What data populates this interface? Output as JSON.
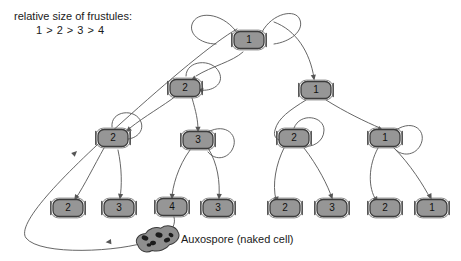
{
  "figure": {
    "legend": {
      "line1": "relative size of frustules:",
      "line2": "1 > 2 > 3 > 4"
    },
    "auxospore_label": "Auxospore (naked cell)",
    "colors": {
      "cell_fill": "#969696",
      "cell_stroke": "#3c3c3c",
      "line": "#555555",
      "background": "#ffffff",
      "auxospore_fill": "#8e8e8e",
      "auxospore_spot": "#1c1c1c",
      "text": "#1a1a1a"
    },
    "cells": [
      {
        "id": "c1",
        "label": "1",
        "x": 249,
        "y": 40
      },
      {
        "id": "c2",
        "label": "2",
        "x": 185,
        "y": 88
      },
      {
        "id": "c3",
        "label": "1",
        "x": 316,
        "y": 90
      },
      {
        "id": "c4",
        "label": "2",
        "x": 113,
        "y": 138
      },
      {
        "id": "c5",
        "label": "3",
        "x": 198,
        "y": 140
      },
      {
        "id": "c6",
        "label": "2",
        "x": 294,
        "y": 138
      },
      {
        "id": "c7",
        "label": "1",
        "x": 385,
        "y": 138
      },
      {
        "id": "c8",
        "label": "2",
        "x": 68,
        "y": 208
      },
      {
        "id": "c9",
        "label": "3",
        "x": 119,
        "y": 208
      },
      {
        "id": "c10",
        "label": "4",
        "x": 172,
        "y": 207
      },
      {
        "id": "c11",
        "label": "3",
        "x": 218,
        "y": 208
      },
      {
        "id": "c12",
        "label": "2",
        "x": 285,
        "y": 208
      },
      {
        "id": "c13",
        "label": "3",
        "x": 332,
        "y": 208
      },
      {
        "id": "c14",
        "label": "2",
        "x": 385,
        "y": 208
      },
      {
        "id": "c15",
        "label": "1",
        "x": 432,
        "y": 208
      }
    ],
    "auxospore": {
      "x": 158,
      "y": 239
    },
    "edges": [
      {
        "name": "aux-to-top-cell-1",
        "d": "M 150 241 C 120 252, 40 256, 26 238 C 16 224, 60 178, 120 124 C 170 79, 214 42, 237 29",
        "arrow_at": [
          [
            107,
            242
          ],
          [
            76,
            152
          ]
        ]
      },
      {
        "name": "cell1-loop-left",
        "d": "M 238 34 C 225 14, 200 10, 193 22 C 187 33, 200 44, 216 44"
      },
      {
        "name": "cell1-to-cell2",
        "d": "M 243 52 C 232 62, 212 66, 196 76",
        "arrow_at": [
          [
            192,
            80
          ]
        ]
      },
      {
        "name": "cell1-loop-right",
        "d": "M 262 32 C 272 13, 296 8, 300 20 C 304 31, 290 42, 274 44"
      },
      {
        "name": "cell1-to-cell3",
        "d": "M 274 22 C 296 30, 310 52, 314 78",
        "arrow_at": [
          [
            314,
            79
          ]
        ]
      },
      {
        "name": "cell2-loop",
        "d": "M 186 76 C 186 60, 212 58, 219 72 C 225 84, 212 92, 200 90",
        "arrow_at": [
          [
            199,
            90
          ]
        ]
      },
      {
        "name": "cell2-to-cell4",
        "d": "M 176 96 C 163 106, 145 116, 130 128",
        "arrow_at": [
          [
            127,
            131
          ]
        ]
      },
      {
        "name": "cell2-to-cell5",
        "d": "M 192 98 C 196 112, 198 120, 198 130",
        "arrow_at": [
          [
            198,
            131
          ]
        ]
      },
      {
        "name": "cell4-loop",
        "d": "M 112 127 C 110 110, 136 108, 141 122 C 145 133, 133 141, 122 139",
        "arrow_at": [
          [
            122,
            139
          ]
        ]
      },
      {
        "name": "cell4-to-cell8",
        "d": "M 104 148 C 94 166, 84 186, 76 198",
        "arrow_at": [
          [
            75,
            199
          ]
        ]
      },
      {
        "name": "cell4-to-cell9",
        "d": "M 118 150 C 122 168, 122 186, 120 198",
        "arrow_at": [
          [
            120,
            198
          ]
        ]
      },
      {
        "name": "cell5-to-cell10",
        "d": "M 190 150 C 178 166, 172 188, 172 198",
        "arrow_at": [
          [
            172,
            198
          ]
        ]
      },
      {
        "name": "cell5-to-cell11",
        "d": "M 208 148 C 218 164, 220 182, 219 198",
        "arrow_at": [
          [
            219,
            198
          ]
        ]
      },
      {
        "name": "cell5-loop-right",
        "d": "M 208 132 C 226 122, 240 136, 232 150 C 226 160, 214 160, 208 152"
      },
      {
        "name": "cell3-to-cell6",
        "d": "M 306 100 C 290 110, 278 118, 275 130 C 272 140, 282 142, 290 141",
        "arrow_at": [
          [
            289,
            141
          ]
        ]
      },
      {
        "name": "cell3-to-cell7",
        "d": "M 326 100 C 345 112, 366 122, 380 128",
        "arrow_at": [
          [
            382,
            130
          ]
        ]
      },
      {
        "name": "cell6-loop",
        "d": "M 294 128 C 300 112, 324 116, 324 130 C 324 142, 312 148, 303 146"
      },
      {
        "name": "cell6-to-cell12",
        "d": "M 284 148 C 276 164, 272 184, 276 200",
        "arrow_at": [
          [
            277,
            201
          ]
        ]
      },
      {
        "name": "cell6-to-cell13",
        "d": "M 304 148 C 318 166, 328 186, 332 198",
        "arrow_at": [
          [
            332,
            198
          ]
        ]
      },
      {
        "name": "cell7-to-cell14",
        "d": "M 378 148 C 368 166, 368 188, 376 200",
        "arrow_at": [
          [
            377,
            201
          ]
        ]
      },
      {
        "name": "cell7-to-cell15",
        "d": "M 394 148 C 410 164, 424 186, 430 198",
        "arrow_at": [
          [
            431,
            198
          ]
        ]
      },
      {
        "name": "cell7-loop",
        "d": "M 396 130 C 414 118, 428 132, 420 146 C 414 156, 402 156, 396 150"
      },
      {
        "name": "cell10-to-auxospore",
        "d": "M 174 217 C 176 224, 172 230, 167 234"
      }
    ]
  }
}
